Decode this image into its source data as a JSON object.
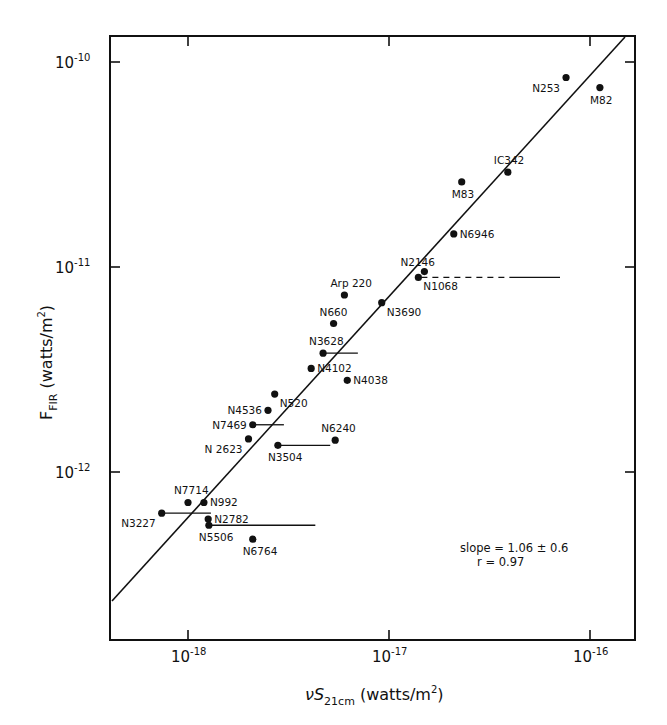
{
  "chart_data": {
    "type": "scatter",
    "title": "",
    "xlabel": "νS21cm (watts/m²)",
    "ylabel": "F_FIR (watts/m²)",
    "xscale": "log",
    "yscale": "log",
    "xlim": [
      4.2e-19,
      1.2e-16
    ],
    "ylim": [
      2.4e-13,
      1.33e-10
    ],
    "grid": false,
    "legend": null,
    "x_ticks": [
      {
        "value": 1e-18,
        "base": "10",
        "exp": "-18"
      },
      {
        "value": 1e-17,
        "base": "10",
        "exp": "-17"
      },
      {
        "value": 1e-16,
        "base": "10",
        "exp": "-16"
      }
    ],
    "y_ticks": [
      {
        "value": 1e-10,
        "base": "10",
        "exp": "-10"
      },
      {
        "value": 1e-11,
        "base": "10",
        "exp": "-11"
      },
      {
        "value": 1e-12,
        "base": "10",
        "exp": "-12"
      }
    ],
    "points": [
      {
        "label": "N253",
        "x": 7.6e-17,
        "y": 8.4e-11,
        "label_pos": "bl"
      },
      {
        "label": "M82",
        "x": 1.12e-16,
        "y": 7.5e-11,
        "label_pos": "b"
      },
      {
        "label": "IC342",
        "x": 3.9e-17,
        "y": 2.9e-11,
        "label_pos": "t"
      },
      {
        "label": "M83",
        "x": 2.3e-17,
        "y": 2.6e-11,
        "label_pos": "b"
      },
      {
        "label": "N6946",
        "x": 2.1e-17,
        "y": 1.45e-11,
        "label_pos": "r"
      },
      {
        "label": "N2146",
        "x": 1.5e-17,
        "y": 9.5e-12,
        "label_pos": "tl"
      },
      {
        "label": "N1068",
        "x": 1.4e-17,
        "y": 8.9e-12,
        "label_pos": "br",
        "xerr_upper": 7e-17,
        "xerr_style": "dashed-solid"
      },
      {
        "label": "Arp 220",
        "x": 6e-18,
        "y": 7.3e-12,
        "label_pos": "t"
      },
      {
        "label": "N3690",
        "x": 9.2e-18,
        "y": 6.7e-12,
        "label_pos": "br"
      },
      {
        "label": "N660",
        "x": 5.3e-18,
        "y": 5.3e-12,
        "label_pos": "t"
      },
      {
        "label": "N3628",
        "x": 4.7e-18,
        "y": 3.8e-12,
        "label_pos": "t",
        "xerr_upper": 7e-18
      },
      {
        "label": "N4102",
        "x": 4.1e-18,
        "y": 3.2e-12,
        "label_pos": "r"
      },
      {
        "label": "N4038",
        "x": 6.2e-18,
        "y": 2.8e-12,
        "label_pos": "r"
      },
      {
        "label": "N520",
        "x": 2.7e-18,
        "y": 2.4e-12,
        "label_pos": "br"
      },
      {
        "label": "N4536",
        "x": 2.5e-18,
        "y": 2e-12,
        "label_pos": "l"
      },
      {
        "label": "N7469",
        "x": 2.1e-18,
        "y": 1.7e-12,
        "label_pos": "l",
        "xerr_upper": 3e-18
      },
      {
        "label": "N 2623",
        "x": 2e-18,
        "y": 1.45e-12,
        "label_pos": "bl"
      },
      {
        "label": "N3504",
        "x": 2.8e-18,
        "y": 1.35e-12,
        "label_pos": "b",
        "xerr_upper": 5.1e-18
      },
      {
        "label": "N6240",
        "x": 5.4e-18,
        "y": 1.43e-12,
        "label_pos": "t"
      },
      {
        "label": "N7714",
        "x": 1e-18,
        "y": 7.1e-13,
        "label_pos": "t"
      },
      {
        "label": "N992",
        "x": 1.2e-18,
        "y": 7.1e-13,
        "label_pos": "r"
      },
      {
        "label": "N3227",
        "x": 7.4e-19,
        "y": 6.3e-13,
        "label_pos": "bl",
        "xerr_upper": 1.3e-18
      },
      {
        "label": "N2782",
        "x": 1.26e-18,
        "y": 5.9e-13,
        "label_pos": "r"
      },
      {
        "label": "N5506",
        "x": 1.27e-18,
        "y": 5.5e-13,
        "label_pos": "b",
        "xerr_upper": 4.3e-18
      },
      {
        "label": "N6764",
        "x": 2.1e-18,
        "y": 4.7e-13,
        "label_pos": "b"
      }
    ],
    "fit_line": {
      "slope": 1.06,
      "from": {
        "x": 4.2e-19,
        "y": 2.6e-13
      },
      "to": {
        "x": 1.35e-16,
        "y": 1.33e-10
      }
    },
    "annotations": [
      "slope = 1.06 ± 0.6",
      "r = 0.97"
    ]
  },
  "axes": {
    "x_label_main": "νS",
    "x_label_sub": "21cm",
    "x_label_units": " (watts/m",
    "x_label_sup": "2",
    "x_label_close": ")",
    "y_label_main": "F",
    "y_label_sub": "FIR",
    "y_label_units": " (watts/m",
    "y_label_sup": "2",
    "y_label_close": ")"
  },
  "annotation": {
    "slope": "slope = 1.06 ± 0.6",
    "r": "r = 0.97"
  }
}
